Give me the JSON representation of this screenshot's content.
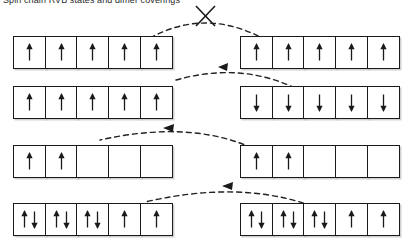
{
  "header": {
    "text": "Spin chain RVB states and dimer coverings"
  },
  "legend": {
    "up_symbol": "↑",
    "down_symbol": "↓",
    "forbidden_symbol": "✕"
  },
  "colors": {
    "line": "#1a1a1a",
    "box_fill": "#ffffff",
    "shadow": "#969696",
    "dash": "#222222"
  },
  "diagram": {
    "cells_per_chain": 5,
    "rows": [
      {
        "id": "row-1",
        "left_chain": {
          "id": "chain-1-left",
          "cells": [
            [
              "up"
            ],
            [
              "up"
            ],
            [
              "up"
            ],
            [
              "up"
            ],
            [
              "up"
            ]
          ]
        },
        "right_chain": {
          "id": "chain-1-right",
          "cells": [
            [
              "up"
            ],
            [
              "up"
            ],
            [
              "up"
            ],
            [
              "up"
            ],
            [
              "up"
            ]
          ]
        },
        "connector": {
          "id": "connector-1",
          "style": "dashed-arc",
          "arrowhead": "none",
          "crossed_out": true,
          "label": "forbidden"
        }
      },
      {
        "id": "row-2",
        "left_chain": {
          "id": "chain-2-left",
          "cells": [
            [
              "up"
            ],
            [
              "up"
            ],
            [
              "up"
            ],
            [
              "up"
            ],
            [
              "up"
            ]
          ]
        },
        "right_chain": {
          "id": "chain-2-right",
          "cells": [
            [
              "down"
            ],
            [
              "down"
            ],
            [
              "down"
            ],
            [
              "down"
            ],
            [
              "down"
            ]
          ]
        },
        "connector": {
          "id": "connector-2",
          "style": "dashed-arc",
          "arrowhead": "left",
          "crossed_out": false,
          "label": "allowed"
        }
      },
      {
        "id": "row-3",
        "left_chain": {
          "id": "chain-3-left",
          "cells": [
            [
              "up"
            ],
            [
              "up"
            ],
            [],
            [],
            []
          ]
        },
        "right_chain": {
          "id": "chain-3-right",
          "cells": [
            [
              "up"
            ],
            [
              "up"
            ],
            [],
            [],
            []
          ]
        },
        "connector": {
          "id": "connector-3",
          "style": "dashed-arc",
          "arrowhead": "left",
          "crossed_out": false,
          "label": "allowed"
        }
      },
      {
        "id": "row-4",
        "left_chain": {
          "id": "chain-4-left",
          "cells": [
            [
              "up",
              "down"
            ],
            [
              "up",
              "down"
            ],
            [
              "up",
              "down"
            ],
            [
              "up"
            ],
            [
              "up"
            ]
          ]
        },
        "right_chain": {
          "id": "chain-4-right",
          "cells": [
            [
              "up",
              "down"
            ],
            [
              "up",
              "down"
            ],
            [
              "up",
              "down"
            ],
            [
              "up"
            ],
            [
              "up"
            ]
          ]
        },
        "connector": {
          "id": "connector-4",
          "style": "dashed-arc",
          "arrowhead": "left",
          "crossed_out": false,
          "label": "allowed"
        }
      }
    ]
  }
}
